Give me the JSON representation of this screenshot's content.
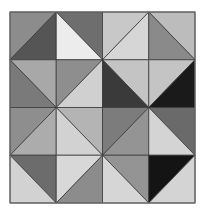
{
  "pattern": {
    "title": "",
    "rows": 4,
    "cols": 4,
    "border_color": "#6a6a6a",
    "line_color": "#3a3a3a",
    "background": "#ffffff",
    "cells": [
      [
        {
          "diagonal": "bl-tr",
          "first": "#8c8c8c",
          "second": "#555555"
        },
        {
          "diagonal": "tl-br",
          "first": "#6e6e6e",
          "second": "#ececec"
        },
        {
          "diagonal": "bl-tr",
          "first": "#c8c8c8",
          "second": "#d6d6d6"
        },
        {
          "diagonal": "tl-br",
          "first": "#bcbcbc",
          "second": "#8a8a8a"
        }
      ],
      [
        {
          "diagonal": "tl-br",
          "first": "#a8a8a8",
          "second": "#7a7a7a"
        },
        {
          "diagonal": "bl-tr",
          "first": "#8e8e8e",
          "second": "#d0d0d0"
        },
        {
          "diagonal": "tl-br",
          "first": "#c4c4c4",
          "second": "#3a3a3a"
        },
        {
          "diagonal": "bl-tr",
          "first": "#c4c4c4",
          "second": "#1a1a1a"
        }
      ],
      [
        {
          "diagonal": "bl-tr",
          "first": "#8e8e8e",
          "second": "#acacac"
        },
        {
          "diagonal": "tl-br",
          "first": "#b4b4b4",
          "second": "#d2d2d2"
        },
        {
          "diagonal": "bl-tr",
          "first": "#7c7c7c",
          "second": "#949494"
        },
        {
          "diagonal": "tl-br",
          "first": "#6a6a6a",
          "second": "#d4d4d4"
        }
      ],
      [
        {
          "diagonal": "tl-br",
          "first": "#6c6c6c",
          "second": "#d2d2d2"
        },
        {
          "diagonal": "bl-tr",
          "first": "#d8d8d8",
          "second": "#8c8c8c"
        },
        {
          "diagonal": "tl-br",
          "first": "#949494",
          "second": "#d6d6d6"
        },
        {
          "diagonal": "bl-tr",
          "first": "#141414",
          "second": "#d4d4d4"
        }
      ]
    ],
    "legend": "bl-tr: first = top-left triangle, second = bottom-right triangle; tl-br: first = top-right triangle, second = bottom-left triangle"
  }
}
